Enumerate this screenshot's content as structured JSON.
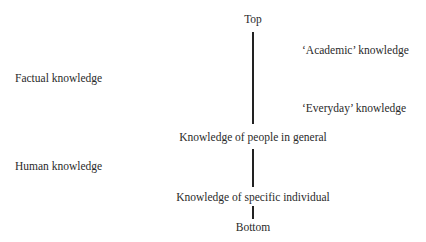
{
  "diagram": {
    "axis": {
      "top": "Top",
      "middle_upper": "Knowledge of people in general",
      "middle_lower": "Knowledge of specific individual",
      "bottom": "Bottom"
    },
    "right_labels": {
      "academic": "‘Academic’ knowledge",
      "everyday": "‘Everyday’ knowledge"
    },
    "left_labels": {
      "factual": "Factual knowledge",
      "human": "Human knowledge"
    },
    "line_color": "#222222"
  }
}
